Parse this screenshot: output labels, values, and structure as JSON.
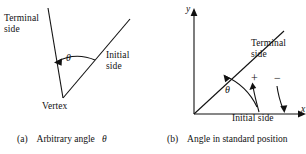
{
  "figure": {
    "background_color": "#ffffff",
    "ink_color": "#111111",
    "panels": [
      {
        "id": "a",
        "caption_prefix": "(a)",
        "caption_text": "Arbitrary angle",
        "caption_symbol": "θ",
        "labels": {
          "terminal_side": "Terminal\nside",
          "initial_side": "Initial\nside",
          "vertex": "Vertex",
          "angle_symbol": "θ"
        },
        "geometry": {
          "vertex": [
            63,
            98
          ],
          "terminal_ray_end": [
            48,
            8
          ],
          "initial_ray_end": [
            130,
            19
          ],
          "arc_direction": "counterclockwise",
          "arrowhead_at": "terminal-side"
        }
      },
      {
        "id": "b",
        "caption_prefix": "(b)",
        "caption_text": "Angle in standard position",
        "caption_symbol": "",
        "labels": {
          "y_axis": "y",
          "x_axis": "x",
          "terminal_side": "Terminal\nside",
          "initial_side": "Initial side",
          "angle_symbol": "θ",
          "positive_direction": "+",
          "negative_direction": "−"
        },
        "geometry": {
          "origin": [
            41,
            114
          ],
          "y_axis_top": [
            41,
            12
          ],
          "x_axis_right": [
            153,
            114
          ],
          "terminal_ray_end": [
            129,
            33
          ],
          "theta_arc_direction": "counterclockwise",
          "plus_arc_direction": "counterclockwise",
          "minus_arc_direction": "clockwise"
        }
      }
    ]
  }
}
